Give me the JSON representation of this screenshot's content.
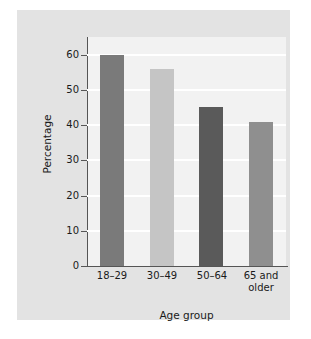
{
  "chart_data": {
    "type": "bar",
    "title": "",
    "xlabel": "Age group",
    "ylabel": "Percentage",
    "categories": [
      "18–29",
      "30–49",
      "50–64",
      "65 and\nolder"
    ],
    "values": [
      60,
      56,
      45,
      41
    ],
    "ylim": [
      0,
      65
    ],
    "yticks": [
      0,
      10,
      20,
      30,
      40,
      50,
      60
    ],
    "ytick_labels": [
      "0",
      "10",
      "20",
      "30",
      "40",
      "50",
      "60"
    ],
    "grid": "horizontal",
    "legend": "none",
    "bar_colors": [
      "#7a7a7a",
      "#c5c5c5",
      "#5a5a5a",
      "#8f8f8f"
    ],
    "panel_color": "#e3e3e3",
    "plot_background": "#f2f2f2",
    "gridline_color": "#ffffff",
    "axis_color": "#555555"
  }
}
